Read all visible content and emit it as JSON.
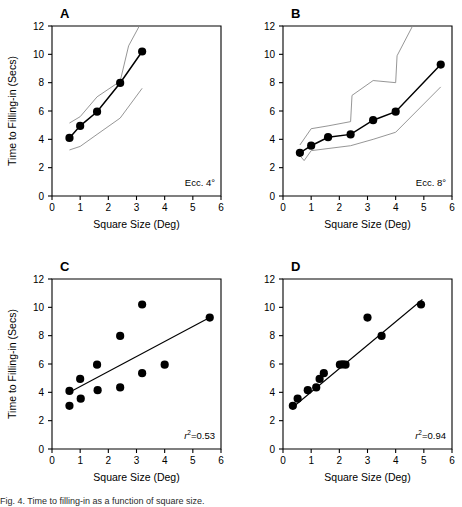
{
  "figure": {
    "panels": [
      {
        "id": "A",
        "letter": "A",
        "annotation": "Ecc. 4°",
        "xlabel": "Square Size (Deg)",
        "ylabel": "Time to Filling-in (Secs)",
        "show_ylabel": true
      },
      {
        "id": "B",
        "letter": "B",
        "annotation": "Ecc. 8°",
        "xlabel": "Square Size (Deg)",
        "ylabel": "Time to Filling-in (Secs)",
        "show_ylabel": false
      },
      {
        "id": "C",
        "letter": "C",
        "annotation_prefix": "r",
        "annotation_sup": "2",
        "annotation_value": "=0.53",
        "xlabel": "Square Size (Deg)",
        "ylabel": "Time to Filling-in (Secs)",
        "show_ylabel": true
      },
      {
        "id": "D",
        "letter": "D",
        "annotation_prefix": "r",
        "annotation_sup": "2",
        "annotation_value": "=0.94",
        "xlabel": "Square Size (Deg)",
        "ylabel": "Time to Filling-in (Secs)",
        "show_ylabel": false
      }
    ],
    "caption": "Fig. 4. Time to filling-in as a function of square size."
  },
  "chart_data": [
    {
      "type": "line",
      "panel": "A",
      "title": "A",
      "xlabel": "Square Size (Deg)",
      "ylabel": "Time to Filling-in (Secs)",
      "xlim": [
        0,
        6
      ],
      "ylim": [
        0,
        12
      ],
      "xticks": [
        0,
        1,
        2,
        3,
        4,
        5,
        6
      ],
      "yticks": [
        0,
        2,
        4,
        6,
        8,
        10,
        12
      ],
      "grid": false,
      "legend": "none",
      "annotation": "Ecc. 4°",
      "series": [
        {
          "name": "mean",
          "style": "line-markers",
          "x": [
            0.62,
            1.0,
            1.6,
            2.42,
            3.2
          ],
          "y": [
            4.1,
            4.95,
            5.95,
            7.98,
            10.2
          ]
        },
        {
          "name": "upper-band",
          "style": "thin-line",
          "x": [
            0.62,
            1.0,
            1.6,
            2.42,
            2.72,
            3.1
          ],
          "y": [
            5.15,
            5.6,
            7.0,
            8.1,
            10.6,
            12.0
          ]
        },
        {
          "name": "lower-band",
          "style": "thin-line",
          "x": [
            0.62,
            1.0,
            1.6,
            2.42,
            3.2
          ],
          "y": [
            3.25,
            3.5,
            4.35,
            5.5,
            7.6
          ]
        }
      ]
    },
    {
      "type": "line",
      "panel": "B",
      "title": "B",
      "xlabel": "Square Size (Deg)",
      "ylabel": "Time to Filling-in (Secs)",
      "xlim": [
        0,
        6
      ],
      "ylim": [
        0,
        12
      ],
      "xticks": [
        0,
        1,
        2,
        3,
        4,
        5,
        6
      ],
      "yticks": [
        0,
        2,
        4,
        6,
        8,
        10,
        12
      ],
      "grid": false,
      "legend": "none",
      "annotation": "Ecc. 8°",
      "series": [
        {
          "name": "mean",
          "style": "line-markers",
          "x": [
            0.6,
            1.0,
            1.6,
            2.4,
            3.2,
            4.0,
            5.6
          ],
          "y": [
            3.05,
            3.55,
            4.15,
            4.35,
            5.35,
            5.95,
            9.28
          ]
        },
        {
          "name": "upper-band",
          "style": "thin-line",
          "x": [
            0.6,
            1.0,
            1.6,
            2.4,
            2.45,
            3.2,
            4.0,
            4.05,
            4.6
          ],
          "y": [
            3.6,
            4.75,
            4.95,
            5.25,
            7.1,
            8.15,
            8.0,
            9.9,
            12.0
          ]
        },
        {
          "name": "lower-band",
          "style": "thin-line",
          "x": [
            0.6,
            0.75,
            1.0,
            1.6,
            2.4,
            3.2,
            4.0,
            5.6
          ],
          "y": [
            2.85,
            2.5,
            3.2,
            3.35,
            3.55,
            4.0,
            4.5,
            7.7
          ]
        }
      ]
    },
    {
      "type": "scatter",
      "panel": "C",
      "title": "C",
      "xlabel": "Square Size (Deg)",
      "ylabel": "Time to Filling-in (Secs)",
      "xlim": [
        0,
        6
      ],
      "ylim": [
        0,
        12
      ],
      "xticks": [
        0,
        1,
        2,
        3,
        4,
        5,
        6
      ],
      "yticks": [
        0,
        2,
        4,
        6,
        8,
        10,
        12
      ],
      "grid": false,
      "legend": "none",
      "annotation": "r2=0.53",
      "r_squared": 0.53,
      "points": [
        {
          "x": 0.62,
          "y": 4.1
        },
        {
          "x": 0.62,
          "y": 3.05
        },
        {
          "x": 1.0,
          "y": 4.95
        },
        {
          "x": 1.02,
          "y": 3.55
        },
        {
          "x": 1.6,
          "y": 5.95
        },
        {
          "x": 1.62,
          "y": 4.15
        },
        {
          "x": 2.42,
          "y": 7.98
        },
        {
          "x": 2.42,
          "y": 4.35
        },
        {
          "x": 3.2,
          "y": 10.2
        },
        {
          "x": 3.2,
          "y": 5.35
        },
        {
          "x": 4.0,
          "y": 5.95
        },
        {
          "x": 5.6,
          "y": 9.28
        }
      ],
      "fit_line": {
        "x": [
          0.62,
          5.6
        ],
        "y": [
          4.0,
          9.28
        ]
      }
    },
    {
      "type": "scatter",
      "panel": "D",
      "title": "D",
      "xlabel": "Square Size (Deg)",
      "ylabel": "Time to Filling-in (Secs)",
      "xlim": [
        0,
        6
      ],
      "ylim": [
        0,
        12
      ],
      "xticks": [
        0,
        1,
        2,
        3,
        4,
        5,
        6
      ],
      "yticks": [
        0,
        2,
        4,
        6,
        8,
        10,
        12
      ],
      "grid": false,
      "legend": "none",
      "annotation": "r2=0.94",
      "r_squared": 0.94,
      "points": [
        {
          "x": 0.35,
          "y": 3.05
        },
        {
          "x": 0.52,
          "y": 3.55
        },
        {
          "x": 0.88,
          "y": 4.15
        },
        {
          "x": 1.18,
          "y": 4.35
        },
        {
          "x": 1.3,
          "y": 4.95
        },
        {
          "x": 1.45,
          "y": 5.35
        },
        {
          "x": 2.02,
          "y": 5.95
        },
        {
          "x": 2.12,
          "y": 5.98
        },
        {
          "x": 2.22,
          "y": 5.95
        },
        {
          "x": 3.0,
          "y": 9.28
        },
        {
          "x": 3.5,
          "y": 7.98
        },
        {
          "x": 4.9,
          "y": 10.2
        }
      ],
      "fit_line": {
        "x": [
          0.35,
          4.95
        ],
        "y": [
          2.95,
          10.55
        ]
      }
    }
  ]
}
